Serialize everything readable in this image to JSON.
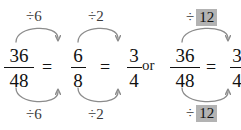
{
  "colors": {
    "ink": "#111111",
    "arrow": "#8c8c8c",
    "highlight": "#b3b3b3",
    "background": "#ffffff"
  },
  "conjunction": "or",
  "left_expression": {
    "fractions": [
      {
        "numerator": "36",
        "denominator": "48"
      },
      {
        "numerator": "6",
        "denominator": "8"
      },
      {
        "numerator": "3",
        "denominator": "4"
      }
    ],
    "equals": [
      "=",
      "="
    ],
    "steps": [
      {
        "top_label": "÷6",
        "bottom_label": "÷6",
        "top_highlight": "",
        "bottom_highlight": ""
      },
      {
        "top_label": "÷2",
        "bottom_label": "÷2",
        "top_highlight": "",
        "bottom_highlight": ""
      }
    ]
  },
  "right_expression": {
    "fractions": [
      {
        "numerator": "36",
        "denominator": "48"
      },
      {
        "numerator": "3",
        "denominator": "4"
      }
    ],
    "equals": [
      "="
    ],
    "steps": [
      {
        "top_label": "÷",
        "bottom_label": "÷",
        "top_highlight": "12",
        "bottom_highlight": "12"
      }
    ]
  }
}
